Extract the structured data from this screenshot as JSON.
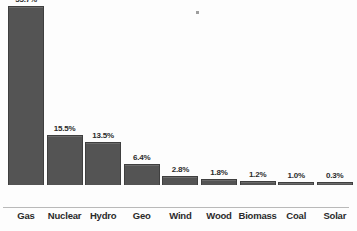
{
  "chart_data": {
    "type": "bar",
    "title": "",
    "subtitle": "",
    "xlabel": "",
    "ylabel": "",
    "categories": [
      "Gas",
      "Nuclear",
      "Hydro",
      "Geo",
      "Wind",
      "Wood",
      "Biomass",
      "Coal",
      "Solar"
    ],
    "values": [
      55.7,
      15.5,
      13.5,
      6.4,
      2.8,
      1.8,
      1.2,
      1.0,
      0.3
    ],
    "value_labels": [
      "55.7%",
      "15.5%",
      "13.5%",
      "6.4%",
      "2.8%",
      "1.8%",
      "1.2%",
      "1.0%",
      "0.3%"
    ],
    "unit": "%",
    "ylim": [
      0,
      55.7
    ],
    "grid": false,
    "legend": false,
    "orientation": "vertical",
    "bar_color": "#545454",
    "bar_border_color": "#3f3f3f",
    "background_color": "#fdfdfd",
    "text_color": "#2b2b2b",
    "axis_color": "#b9b9b9"
  },
  "bars": [
    {
      "category": "Gas",
      "value_label": "55.7%"
    },
    {
      "category": "Nuclear",
      "value_label": "15.5%"
    },
    {
      "category": "Hydro",
      "value_label": "13.5%"
    },
    {
      "category": "Geo",
      "value_label": "6.4%"
    },
    {
      "category": "Wind",
      "value_label": "2.8%"
    },
    {
      "category": "Wood",
      "value_label": "1.8%"
    },
    {
      "category": "Biomass",
      "value_label": "1.2%"
    },
    {
      "category": "Coal",
      "value_label": "1.0%"
    },
    {
      "category": "Solar",
      "value_label": "0.3%"
    }
  ]
}
